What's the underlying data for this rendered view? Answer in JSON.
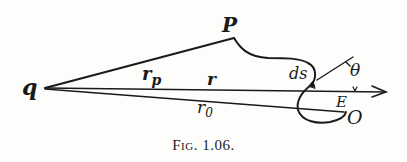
{
  "figure": {
    "caption_prefix": "Fig.",
    "caption_number": "1.06.",
    "labels": {
      "q": "q",
      "P": "P",
      "r_p_base": "r",
      "r_p_sub": "p",
      "r": "r",
      "r_0_base": "r",
      "r_0_sub": "0",
      "ds": "ds",
      "theta": "θ",
      "E": "E",
      "O": "O"
    },
    "colors": {
      "ink": "#1a1a1a",
      "paper": "#fdfdfc"
    }
  }
}
